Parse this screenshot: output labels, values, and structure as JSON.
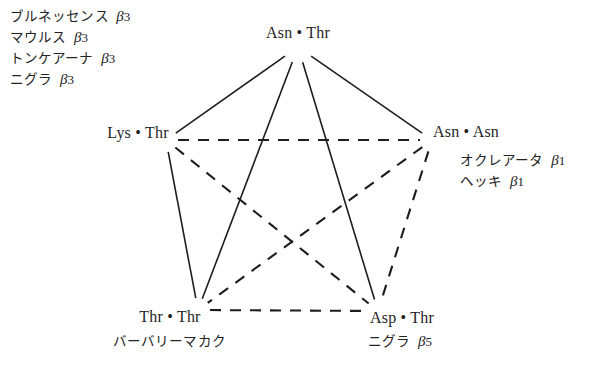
{
  "figure": {
    "type": "network-diagram",
    "nodes": [
      {
        "id": "top",
        "label": "Asn • Thr",
        "x": 298,
        "y": 33
      },
      {
        "id": "left",
        "label": "Lys • Thr",
        "x": 138,
        "y": 133
      },
      {
        "id": "right",
        "label": "Asn • Asn",
        "x": 466,
        "y": 132
      },
      {
        "id": "bottom_left",
        "label": "Thr • Thr",
        "x": 170,
        "y": 317
      },
      {
        "id": "bottom_right",
        "label": "Asp • Thr",
        "x": 402,
        "y": 318
      }
    ],
    "edges": [
      {
        "from": "top",
        "to": "left",
        "style": "solid"
      },
      {
        "from": "top",
        "to": "right",
        "style": "solid"
      },
      {
        "from": "top",
        "to": "bottom_left",
        "style": "solid"
      },
      {
        "from": "top",
        "to": "bottom_right",
        "style": "solid"
      },
      {
        "from": "left",
        "to": "bottom_left",
        "style": "solid"
      },
      {
        "from": "left",
        "to": "right",
        "style": "dashed"
      },
      {
        "from": "left",
        "to": "bottom_right",
        "style": "dashed"
      },
      {
        "from": "right",
        "to": "bottom_left",
        "style": "dashed"
      },
      {
        "from": "right",
        "to": "bottom_right",
        "style": "dashed"
      },
      {
        "from": "bottom_left",
        "to": "bottom_right",
        "style": "dashed"
      }
    ],
    "line_color": "#1d1d1d"
  },
  "annotations": {
    "top_left": {
      "lines": [
        {
          "name": "ブルネッセンス",
          "beta": "β",
          "num": "3"
        },
        {
          "name": "マウルス",
          "beta": "β",
          "num": "3"
        },
        {
          "name": "トンケアーナ",
          "beta": "β",
          "num": "3"
        },
        {
          "name": "ニグラ",
          "beta": "β",
          "num": "3"
        }
      ]
    },
    "right": {
      "lines": [
        {
          "name": "オクレアータ",
          "beta": "β",
          "num": "1"
        },
        {
          "name": "ヘッキ",
          "beta": "β",
          "num": "1"
        }
      ]
    },
    "bottom_left": {
      "lines": [
        {
          "name": "バーバリーマカク",
          "beta": "",
          "num": ""
        }
      ]
    },
    "bottom_right": {
      "lines": [
        {
          "name": "ニグラ",
          "beta": "β",
          "num": "5"
        }
      ]
    }
  }
}
